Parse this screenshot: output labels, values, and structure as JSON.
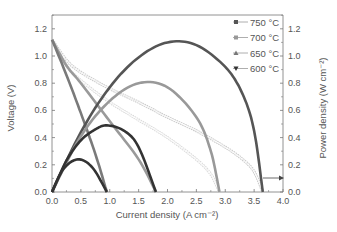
{
  "chart_data": {
    "type": "line",
    "title": "",
    "xlabel": "Current density (A cm⁻²)",
    "ylabel": "Voltage (V)",
    "y2label": "Power density (W cm⁻²)",
    "xlim": [
      0,
      4.0
    ],
    "ylim": [
      0,
      1.3
    ],
    "y2lim": [
      0,
      1.3
    ],
    "xticks": [
      "0.0",
      "0.5",
      "1.0",
      "1.5",
      "2.0",
      "2.5",
      "3.0",
      "3.5",
      "4.0"
    ],
    "yticks": [
      "0.0",
      "0.2",
      "0.4",
      "0.6",
      "0.8",
      "1.0",
      "1.2"
    ],
    "y2ticks": [
      "0.0",
      "0.2",
      "0.4",
      "0.6",
      "0.8",
      "1.0",
      "1.2"
    ],
    "grid": false,
    "legend_position": "upper right",
    "legend": [
      {
        "label": "750 °C",
        "marker": "square",
        "color": "#555555"
      },
      {
        "label": "700 °C",
        "marker": "circle",
        "color": "#999999"
      },
      {
        "label": "650 °C",
        "marker": "triangle-up",
        "color": "#777777"
      },
      {
        "label": "600 °C",
        "marker": "triangle-down",
        "color": "#333333"
      }
    ],
    "series": [
      {
        "name": "750 °C voltage",
        "axis": "left",
        "x": [
          0,
          0.25,
          0.5,
          1.0,
          1.5,
          2.0,
          2.5,
          3.0,
          3.3,
          3.5,
          3.65
        ],
        "values": [
          1.12,
          0.97,
          0.88,
          0.76,
          0.66,
          0.55,
          0.45,
          0.33,
          0.24,
          0.15,
          0.0
        ]
      },
      {
        "name": "700 °C voltage",
        "axis": "left",
        "x": [
          0,
          0.25,
          0.5,
          1.0,
          1.5,
          2.0,
          2.5,
          2.75,
          2.9
        ],
        "values": [
          1.12,
          0.93,
          0.82,
          0.66,
          0.53,
          0.4,
          0.24,
          0.13,
          0.0
        ]
      },
      {
        "name": "650 °C voltage",
        "axis": "left",
        "x": [
          0,
          0.25,
          0.5,
          1.0,
          1.5,
          1.8
        ],
        "values": [
          1.12,
          0.93,
          0.8,
          0.52,
          0.24,
          0.0
        ]
      },
      {
        "name": "600 °C voltage",
        "axis": "left",
        "x": [
          0,
          0.25,
          0.5,
          0.75,
          0.95
        ],
        "values": [
          1.12,
          0.86,
          0.58,
          0.28,
          0.0
        ]
      },
      {
        "name": "750 °C power",
        "axis": "right",
        "x": [
          0,
          0.5,
          1.0,
          1.5,
          2.0,
          2.5,
          3.0,
          3.3,
          3.5,
          3.65
        ],
        "values": [
          0,
          0.44,
          0.77,
          0.99,
          1.1,
          1.08,
          0.92,
          0.72,
          0.45,
          0.0
        ]
      },
      {
        "name": "700 °C power",
        "axis": "right",
        "x": [
          0,
          0.5,
          1.0,
          1.5,
          2.0,
          2.5,
          2.75,
          2.9
        ],
        "values": [
          0,
          0.41,
          0.67,
          0.8,
          0.77,
          0.55,
          0.3,
          0.0
        ]
      },
      {
        "name": "650 °C power",
        "axis": "right",
        "x": [
          0,
          0.25,
          0.5,
          0.75,
          0.95,
          1.25,
          1.5,
          1.8
        ],
        "values": [
          0,
          0.23,
          0.38,
          0.46,
          0.49,
          0.45,
          0.33,
          0.0
        ]
      },
      {
        "name": "600 °C power",
        "axis": "right",
        "x": [
          0,
          0.2,
          0.45,
          0.7,
          0.95
        ],
        "values": [
          0,
          0.17,
          0.24,
          0.18,
          0.0
        ]
      }
    ],
    "annotations": [
      {
        "type": "arrow",
        "text": "",
        "from_x": 3.68,
        "to_x": 3.98,
        "y_right": 0.1,
        "meaning": "power curves read on right axis"
      }
    ]
  }
}
